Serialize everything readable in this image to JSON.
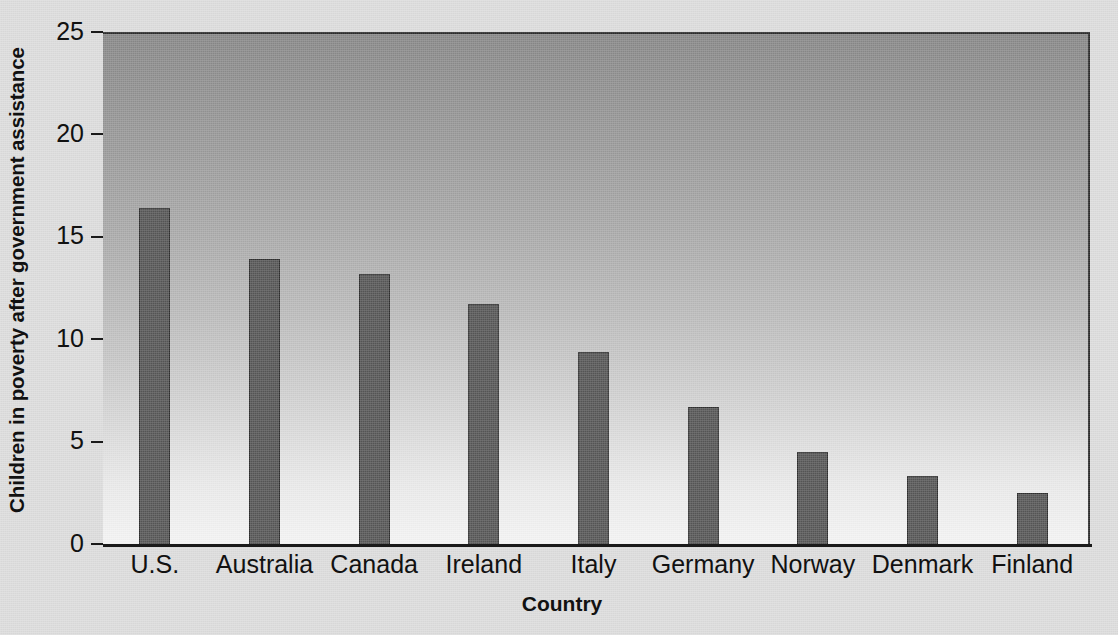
{
  "chart_data": {
    "type": "bar",
    "title": "",
    "xlabel": "Country",
    "ylabel": "Children in poverty after government assistance",
    "categories": [
      "U.S.",
      "Australia",
      "Canada",
      "Ireland",
      "Italy",
      "Germany",
      "Norway",
      "Denmark",
      "Finland"
    ],
    "values": [
      16.4,
      13.9,
      13.2,
      11.7,
      9.4,
      6.7,
      4.5,
      3.3,
      2.5
    ],
    "ylim": [
      0,
      25
    ],
    "yticks": [
      0,
      5,
      10,
      15,
      20,
      25
    ],
    "ytick_labels": [
      "0",
      "5",
      "10",
      "15",
      "20",
      "25"
    ],
    "grid": false,
    "legend": null,
    "colors": {
      "bar_fill": "#565656",
      "bar_edge": "#2e2e2e",
      "axis": "#1a1a1a",
      "text": "#111111",
      "plot_bg_top": "#878787",
      "plot_bg_bottom": "#f4f4f4",
      "figure_bg": "#dcdcdc"
    }
  }
}
